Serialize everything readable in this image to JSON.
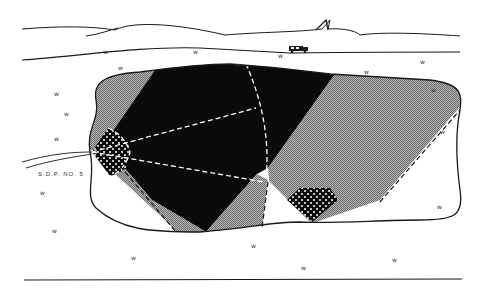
{
  "diagram": {
    "type": "mine-map-sketch",
    "labels": {
      "pipe_label": "S.D.P. NO. 5"
    },
    "legend_regions": [
      {
        "name": "dark-zone",
        "fill": "#0a0a0a"
      },
      {
        "name": "stippled-zone",
        "fill": "#9a9a9a"
      },
      {
        "name": "dotted-zone",
        "fill": "#111111"
      },
      {
        "name": "open-zone",
        "fill": "#ffffff"
      }
    ],
    "grass_glyph": "ᴡ",
    "colors": {
      "ink": "#1a1a1a",
      "dark": "#0a0a0a",
      "stipple": "#9a9a9a",
      "dash": "#ffffff",
      "background": "#ffffff"
    }
  }
}
